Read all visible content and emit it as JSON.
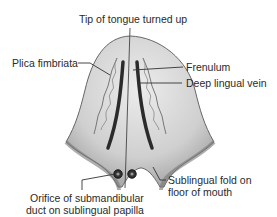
{
  "figure": {
    "labels": {
      "tip": "Tip of tongue turned up",
      "plica": "Plica fimbriata",
      "frenulum": "Frenulum",
      "vein": "Deep lingual vein",
      "fold_line1": "Sublingual fold on",
      "fold_line2": "floor of mouth",
      "orifice_line1": "Orifice of submandibular",
      "orifice_line2": "duct on sublingual papilla"
    },
    "colors": {
      "tongue_fill": "#c8c8c8",
      "tongue_highlight": "#e6e6e6",
      "outline": "#555555",
      "vein": "#2b2b2b",
      "leader": "#333333"
    }
  }
}
